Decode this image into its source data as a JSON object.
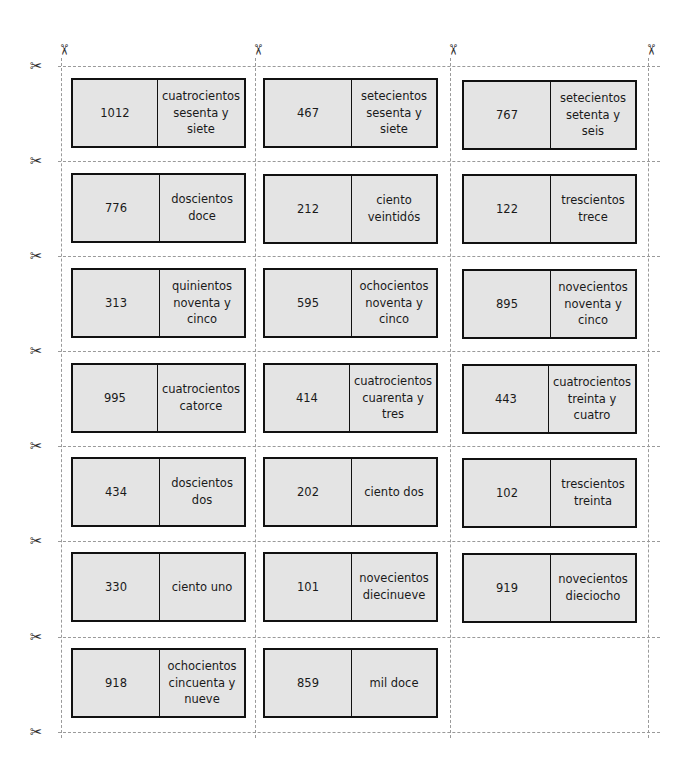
{
  "sheet": {
    "type": "matching-cards-cutout",
    "columns": 3,
    "rows": 7,
    "scissors_glyph": "✂",
    "colors": {
      "card_fill": "#e4e4e4",
      "card_border": "#111111",
      "guide_line": "#9a9a9a"
    }
  },
  "cards": [
    {
      "number": "1012",
      "words": "cuatrocientos sesenta y siete"
    },
    {
      "number": "467",
      "words": "setecientos sesenta y siete"
    },
    {
      "number": "767",
      "words": "setecientos setenta y seis"
    },
    {
      "number": "776",
      "words": "doscientos doce"
    },
    {
      "number": "212",
      "words": "ciento veintidós"
    },
    {
      "number": "122",
      "words": "trescientos trece"
    },
    {
      "number": "313",
      "words": "quinientos noventa y cinco"
    },
    {
      "number": "595",
      "words": "ochocientos noventa y cinco"
    },
    {
      "number": "895",
      "words": "novecientos noventa y cinco"
    },
    {
      "number": "995",
      "words": "cuatrocientos catorce"
    },
    {
      "number": "414",
      "words": "cuatrocientos cuarenta y tres"
    },
    {
      "number": "443",
      "words": "cuatrocientos treinta y cuatro"
    },
    {
      "number": "434",
      "words": "doscientos dos"
    },
    {
      "number": "202",
      "words": "ciento dos"
    },
    {
      "number": "102",
      "words": "trescientos treinta"
    },
    {
      "number": "330",
      "words": "ciento uno"
    },
    {
      "number": "101",
      "words": "novecientos diecinueve"
    },
    {
      "number": "919",
      "words": "novecientos dieciocho"
    },
    {
      "number": "918",
      "words": "ochocientos cincuenta y nueve"
    },
    {
      "number": "859",
      "words": "mil doce"
    }
  ]
}
